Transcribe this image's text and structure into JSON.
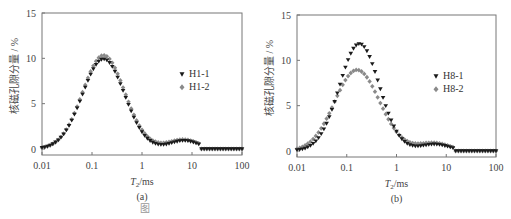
{
  "chart_data": [
    {
      "type": "scatter",
      "panel_label": "(a)",
      "title": "",
      "xlabel_main": "T",
      "xlabel_sub": "2",
      "xlabel_unit": "/ms",
      "ylabel": "核磁孔隙分量 / %",
      "xscale": "log",
      "xlim": [
        0.01,
        100
      ],
      "ylim": [
        0,
        15
      ],
      "xticks": [
        "0.01",
        "0.1",
        "1",
        "10",
        "100"
      ],
      "yticks": [
        "0",
        "5",
        "10",
        "15"
      ],
      "grid": false,
      "legend_position": "right-middle",
      "series": [
        {
          "name": "H1-1",
          "marker": "triangle-down",
          "color": "#1a1a1a",
          "peak1": {
            "x": 0.17,
            "y": 9.9,
            "width": 0.42
          },
          "trough": {
            "x": 2.2,
            "y": 0.0
          },
          "peak2": {
            "x": 7,
            "y": 0.9
          }
        },
        {
          "name": "H1-2",
          "marker": "diamond",
          "color": "#8a8a8a",
          "peak1": {
            "x": 0.17,
            "y": 10.3,
            "width": 0.42
          },
          "trough": {
            "x": 2.2,
            "y": 0.35
          },
          "peak2": {
            "x": 7,
            "y": 1.0
          }
        }
      ]
    },
    {
      "type": "scatter",
      "panel_label": "(b)",
      "title": "",
      "xlabel_main": "T",
      "xlabel_sub": "2",
      "xlabel_unit": "/ms",
      "ylabel": "核磁孔隙分量 / %",
      "xscale": "log",
      "xlim": [
        0.01,
        100
      ],
      "ylim": [
        0,
        15
      ],
      "xticks": [
        "0.01",
        "0.1",
        "1",
        "10",
        "100"
      ],
      "yticks": [
        "0",
        "5",
        "10",
        "15"
      ],
      "grid": false,
      "legend_position": "right-middle",
      "series": [
        {
          "name": "H8-1",
          "marker": "triangle-down",
          "color": "#1a1a1a",
          "peak1": {
            "x": 0.18,
            "y": 11.8,
            "width": 0.4
          },
          "trough": {
            "x": 2.4,
            "y": 0.1
          },
          "peak2": {
            "x": 6,
            "y": 0.7
          }
        },
        {
          "name": "H8-2",
          "marker": "diamond",
          "color": "#8a8a8a",
          "peak1": {
            "x": 0.16,
            "y": 8.9,
            "width": 0.45
          },
          "trough": {
            "x": 2.4,
            "y": 0.5
          },
          "peak2": {
            "x": 6,
            "y": 0.8
          }
        }
      ]
    }
  ],
  "caption": "图"
}
